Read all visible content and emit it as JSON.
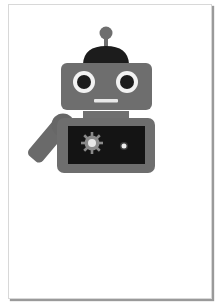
{
  "illustration": {
    "subject": "robot",
    "colors": {
      "body": "#6e6e6e",
      "dark": "#1c1c1c",
      "screen": "#141414",
      "eye_white": "#f2f2f2",
      "mouth": "#e8e8e8",
      "gear": "#8a8a8a",
      "gear_center": "#e6e6e6",
      "dot": "#eeeeee",
      "page_border": "#d8d8d8",
      "page_shadow": "#9a9a9a"
    }
  }
}
